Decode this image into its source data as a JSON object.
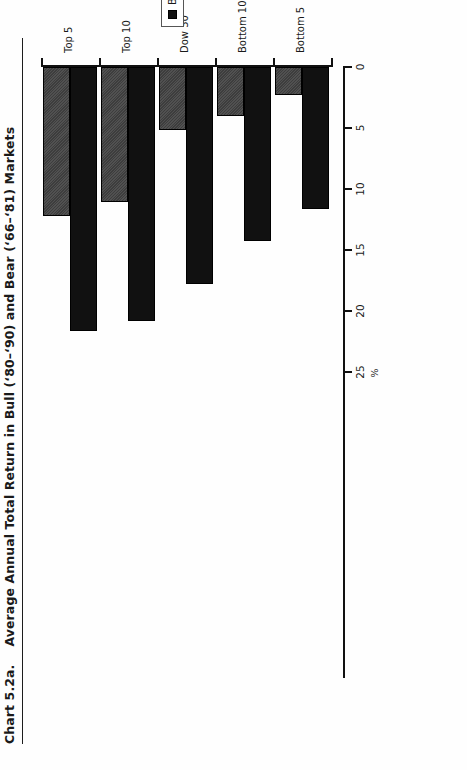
{
  "page": {
    "figure_number": "Chart 5.2a.",
    "title": "Average Annual Total Return in Bull (‘80–‘90) and Bear (‘66–‘81) Markets"
  },
  "legend": {
    "position": "inside-right",
    "items": [
      {
        "label": "Bull Market",
        "color": "#111111",
        "key": "bull"
      },
      {
        "label": "Bear Market",
        "color": "#3d3d3d",
        "key": "bear"
      }
    ]
  },
  "chart_data": {
    "type": "bar",
    "orientation": "horizontal",
    "title": "Average Annual Total Return in Bull (‘80–‘90) and Bear (‘66–‘81) Markets",
    "categories": [
      "Top 5",
      "Top 10",
      "Dow 30",
      "Bottom 10",
      "Bottom 5"
    ],
    "series": [
      {
        "name": "Bull Market",
        "values": [
          21.6,
          20.8,
          17.8,
          14.3,
          11.6
        ]
      },
      {
        "name": "Bear Market",
        "values": [
          12.2,
          11.1,
          5.2,
          4.0,
          2.3
        ]
      }
    ],
    "xlabel": "%",
    "ylabel": "",
    "ticks": [
      0,
      5,
      10,
      15,
      20,
      25
    ],
    "tick_labels": [
      "0",
      "5",
      "10",
      "15",
      "20",
      "25"
    ],
    "xlim": [
      0,
      25
    ],
    "axis_reversed": true,
    "grid": false,
    "legend_entries": [
      "Bull Market",
      "Bear Market"
    ]
  }
}
